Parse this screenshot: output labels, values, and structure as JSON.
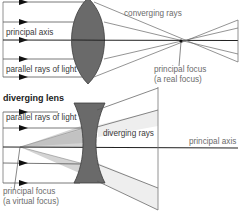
{
  "colors": {
    "lens_fill": "#6a6a6a",
    "lens_stroke": "#3c3c3c",
    "ray": "#555555",
    "axis": "#222222",
    "shade": "#cfcfcf",
    "label": "#6b6b6b"
  },
  "converging": {
    "labels": {
      "converging_rays": "converging rays",
      "principal_axis": "principal axis",
      "parallel_rays": "parallel rays of light",
      "focus_line1": "principal focus",
      "focus_line2": "(a real focus)"
    }
  },
  "diverging": {
    "heading": "diverging lens",
    "labels": {
      "parallel_rays": "parallel rays of light",
      "diverging_rays": "diverging rays",
      "principal_axis": "principal axis",
      "focus_line1": "principal focus",
      "focus_line2": "(a virtual focus)"
    }
  }
}
